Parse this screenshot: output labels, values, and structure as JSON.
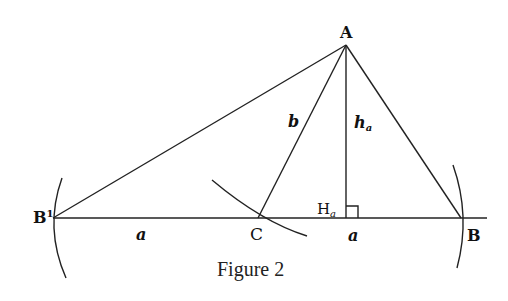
{
  "figure": {
    "caption": "Figure 2",
    "points": {
      "A": "A",
      "B": "B",
      "B1": "B",
      "B1_superscript": "1",
      "C": "C",
      "Ha": "H",
      "Ha_subscript": "a"
    },
    "segment_labels": {
      "b": "b",
      "ha": "h",
      "ha_subscript": "a",
      "a_left": "a",
      "a_right": "a"
    },
    "colors": {
      "line": "#222222",
      "background": "#ffffff"
    }
  }
}
